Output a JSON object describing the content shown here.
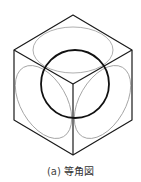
{
  "figure": {
    "type": "isometric drawing",
    "caption_label": "(a)",
    "caption_text": "等角図",
    "caption": "(a) 等角図",
    "colors": {
      "edges": "#1a1a1a",
      "sphere": "#111111",
      "face_ellipses": "#9a9a9a"
    }
  }
}
